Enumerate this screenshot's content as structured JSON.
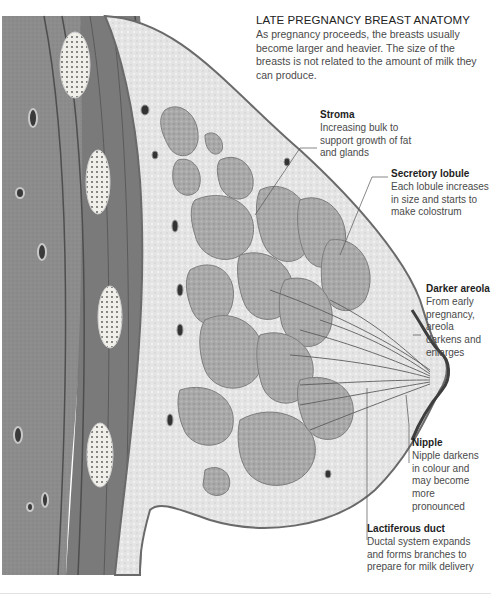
{
  "diagram": {
    "title": "LATE PREGNANCY BREAST ANATOMY",
    "intro": "As pregnancy proceeds, the breasts usually become larger and heavier. The size of the breasts is not related to the amount of milk they can produce.",
    "labels": [
      {
        "id": "stroma",
        "heading": "Stroma",
        "text": "Increasing bulk to support growth of fat and glands"
      },
      {
        "id": "secretory-lobule",
        "heading": "Secretory lobule",
        "text": "Each lobule increases in size and starts to make colostrum"
      },
      {
        "id": "darker-areola",
        "heading": "Darker areola",
        "text": "From early pregnancy, areola darkens and enlarges"
      },
      {
        "id": "nipple",
        "heading": "Nipple",
        "text": "Nipple darkens in colour and may become more pronounced"
      },
      {
        "id": "lactiferous-duct",
        "heading": "Lactiferous duct",
        "text": "Ductal system expands and forms branches to prepare for milk delivery"
      }
    ],
    "colors": {
      "chest_wall": "#8a8a8a",
      "muscle": "#7c7c7c",
      "fat": "#e6e6e6",
      "lobule": "#a9a9a9",
      "skin_edge": "#6a6a6a"
    }
  }
}
